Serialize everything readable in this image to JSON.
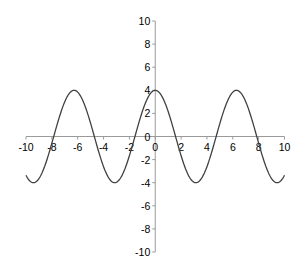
{
  "chart_data": {
    "type": "line",
    "title": "",
    "xlabel": "",
    "ylabel": "",
    "function": "y = 4*cos(x)",
    "xlim": [
      -10,
      10
    ],
    "ylim": [
      -10,
      10
    ],
    "x_ticks": [
      -10,
      -8,
      -6,
      -4,
      -2,
      0,
      2,
      4,
      6,
      8,
      10
    ],
    "y_ticks": [
      -10,
      -8,
      -6,
      -4,
      -2,
      0,
      2,
      4,
      6,
      8,
      10
    ],
    "grid": false,
    "legend": null,
    "series": [
      {
        "name": "y",
        "color": "#404040",
        "x": [
          -10,
          -9.5,
          -9,
          -8.5,
          -8,
          -7.5,
          -7,
          -6.5,
          -6,
          -5.5,
          -5,
          -4.5,
          -4,
          -3.5,
          -3,
          -2.5,
          -2,
          -1.5,
          -1,
          -0.5,
          0,
          0.5,
          1,
          1.5,
          2,
          2.5,
          3,
          3.5,
          4,
          4.5,
          5,
          5.5,
          6,
          6.5,
          7,
          7.5,
          8,
          8.5,
          9,
          9.5,
          10
        ],
        "values": [
          -3.36,
          -3.99,
          -3.64,
          -2.41,
          -0.58,
          1.39,
          3.02,
          3.95,
          3.84,
          2.83,
          1.13,
          -0.84,
          -2.61,
          -3.75,
          -3.96,
          -3.2,
          -1.66,
          0.28,
          2.16,
          3.51,
          4.0,
          3.51,
          2.16,
          0.28,
          -1.66,
          -3.2,
          -3.96,
          -3.75,
          -2.61,
          -0.84,
          1.13,
          2.83,
          3.84,
          3.95,
          3.02,
          1.39,
          -0.58,
          -2.41,
          -3.64,
          -3.99,
          -3.36
        ]
      }
    ]
  },
  "colors": {
    "axis": "#9a9a9a",
    "curve": "#404040",
    "background": "#ffffff"
  }
}
